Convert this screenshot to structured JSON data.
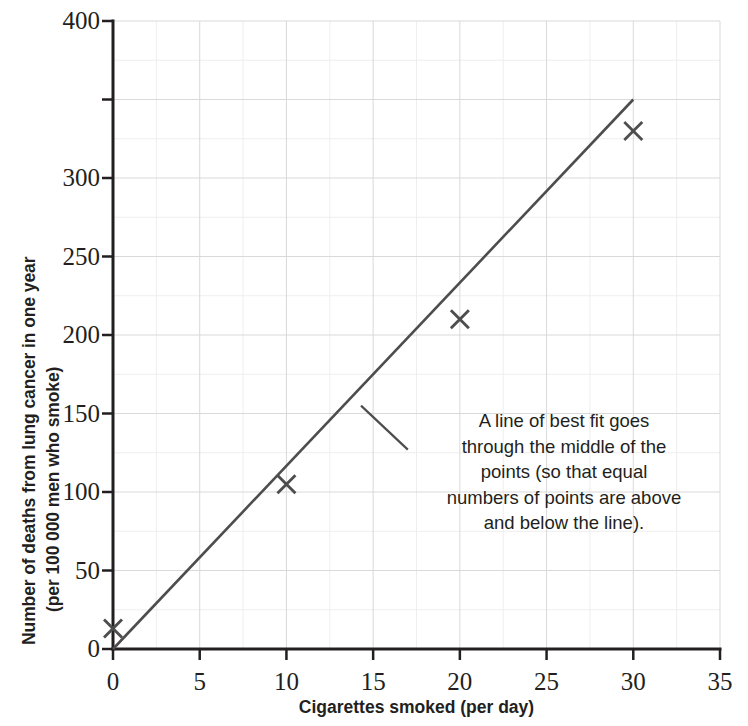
{
  "chart_data": {
    "type": "scatter",
    "title": "",
    "xlabel": "Cigarettes smoked (per day)",
    "ylabel_line1": "Number of deaths from lung cancer in one year",
    "ylabel_line2": "(per 100 000 men who smoke)",
    "xlim": [
      0,
      35
    ],
    "ylim": [
      0,
      400
    ],
    "xticks": [
      0,
      5,
      10,
      15,
      20,
      25,
      30,
      35
    ],
    "xtick_labels": [
      "0",
      "5",
      "10",
      "15",
      "20",
      "25",
      "30",
      "35"
    ],
    "yticks": [
      0,
      50,
      100,
      150,
      200,
      250,
      300,
      350,
      400
    ],
    "ytick_labels": [
      "0",
      "50",
      "100",
      "150",
      "200",
      "250",
      "300",
      "",
      "400"
    ],
    "grid": true,
    "grid_minor": true,
    "legend": "none",
    "marker": "x-cross",
    "series": [
      {
        "name": "Deaths from lung cancer",
        "x": [
          0,
          10,
          20,
          30
        ],
        "values": [
          13,
          105,
          210,
          330
        ]
      }
    ],
    "trendline": {
      "name": "line of best fit",
      "x": [
        0,
        30
      ],
      "values": [
        0,
        350
      ]
    },
    "annotations": [
      {
        "text": "A line of best fit goes through the middle of the points (so that equal numbers of points are above and below the line).",
        "lines": [
          "A line of best fit goes",
          "through the middle of the",
          "points (so that equal",
          "numbers of points are above",
          "and below the line)."
        ],
        "leader_from": [
          14.3,
          155
        ],
        "leader_to": [
          17.0,
          127
        ]
      }
    ],
    "colors": {
      "axis": "#231f20",
      "text": "#231f20",
      "trendline": "#4d4d4d",
      "marker": "#4d4d4d",
      "grid_major": "#d9d9d9",
      "grid_minor": "#eeeeee",
      "background": "#ffffff"
    }
  }
}
